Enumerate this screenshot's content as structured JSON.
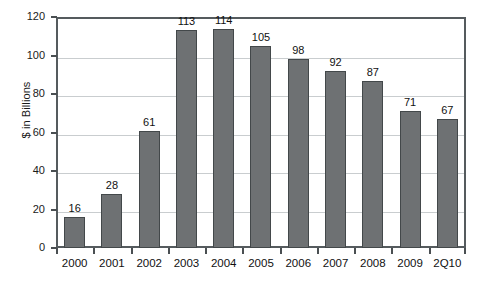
{
  "chart_data": {
    "type": "bar",
    "title": "",
    "subtitle": "",
    "xlabel": "",
    "ylabel": "$ in Billions",
    "categories": [
      "2000",
      "2001",
      "2002",
      "2003",
      "2004",
      "2005",
      "2006",
      "2007",
      "2008",
      "2009",
      "2Q10"
    ],
    "values": [
      16,
      28,
      61,
      113,
      114,
      105,
      98,
      92,
      87,
      71,
      67
    ],
    "data_labels": [
      "16",
      "28",
      "61",
      "113",
      "114",
      "105",
      "98",
      "92",
      "87",
      "71",
      "67"
    ],
    "ylim": [
      0,
      120
    ],
    "ytick_values": [
      0,
      20,
      40,
      60,
      80,
      100,
      120
    ],
    "ytick_labels": [
      "0",
      "20",
      "40",
      "60",
      "80",
      "100",
      "120"
    ],
    "grid": true,
    "grid_axis": "y",
    "legend": false,
    "legend_position": "none",
    "bar_color": "#6e7173",
    "bar_border_color": "#43484a",
    "grid_color": "#c9cdcf",
    "axis_color": "#555b5e",
    "background_color": "#ffffff",
    "text_color": "#111111"
  }
}
